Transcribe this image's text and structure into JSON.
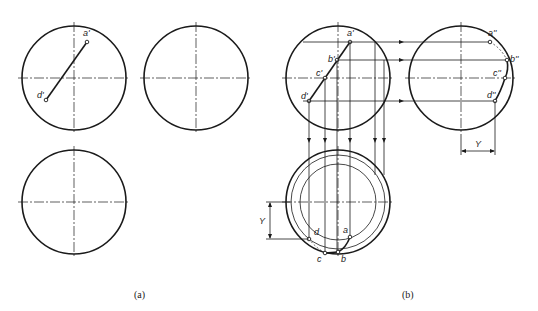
{
  "figure": {
    "panels": [
      {
        "caption": "(a)",
        "views": [
          "front",
          "side",
          "top"
        ],
        "points": [
          {
            "label": "a'",
            "view": "front"
          },
          {
            "label": "d'",
            "view": "front"
          }
        ]
      },
      {
        "caption": "(b)",
        "views": [
          "front",
          "side",
          "top"
        ],
        "points": [
          {
            "label": "a'",
            "view": "front"
          },
          {
            "label": "b'",
            "view": "front"
          },
          {
            "label": "c'",
            "view": "front"
          },
          {
            "label": "d'",
            "view": "front"
          },
          {
            "label": "a''",
            "view": "side"
          },
          {
            "label": "b''",
            "view": "side"
          },
          {
            "label": "c''",
            "view": "side"
          },
          {
            "label": "d''",
            "view": "side"
          },
          {
            "label": "a",
            "view": "top"
          },
          {
            "label": "b",
            "view": "top"
          },
          {
            "label": "c",
            "view": "top"
          },
          {
            "label": "d",
            "view": "top"
          }
        ],
        "dimensions": [
          {
            "label": "Y",
            "view": "side"
          },
          {
            "label": "Y",
            "view": "top"
          }
        ]
      }
    ]
  },
  "labels": {
    "a_front_a": "a'",
    "a_front_d": "d'",
    "b_front_a": "a'",
    "b_front_b": "b'",
    "b_front_c": "c'",
    "b_front_d": "d'",
    "b_side_a": "a''",
    "b_side_b": "b''",
    "b_side_c": "c''",
    "b_side_d": "d''",
    "b_top_a": "a",
    "b_top_b": "b",
    "b_top_c": "c",
    "b_top_d": "d",
    "dim_side_y": "Y",
    "dim_top_y": "Y",
    "caption_a": "(a)",
    "caption_b": "(b)"
  }
}
